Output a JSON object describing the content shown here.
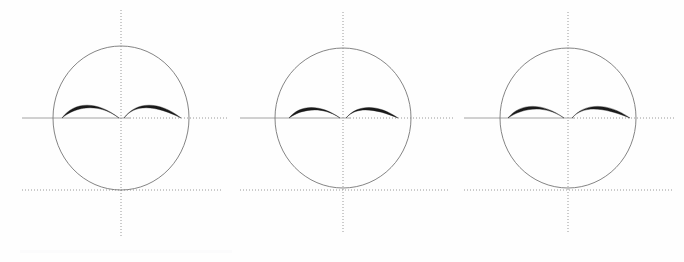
{
  "canvas": {
    "width": 684,
    "height": 262,
    "background_color": "#fefefe",
    "title": "Three circle-and-axis constructions with paired crescent arcs"
  },
  "style_tokens": {
    "circle_stroke_color": "#767676",
    "circle_stroke_width": 0.9,
    "axis_solid_color": "#9a9a9a",
    "axis_dotted_color": "#8f8f8f",
    "axis_stroke_width": 0.9,
    "axis_dash_pattern": "1 2",
    "crescent_fill_color": "#1a1a1a",
    "smudge_color": "#fbfbfc"
  },
  "figures": [
    {
      "id": "figure-1",
      "label": "figure-1",
      "panel_left": 0,
      "panel_width": 232,
      "circle": {
        "cx": 121,
        "cy": 118,
        "rx": 68,
        "ry": 72
      },
      "vertical_axis": {
        "x": 121,
        "y1": 10,
        "y2": 236,
        "style": "dotted"
      },
      "horizontal_center_axis": {
        "y": 118,
        "x1": 22,
        "x2": 228,
        "style": "solid-with-dotted-tail",
        "solid_to": 130
      },
      "horizontal_tangent_axis": {
        "y": 190,
        "x1": 22,
        "x2": 222,
        "style": "dotted"
      },
      "left_crescent": {
        "x_start": 62,
        "x_end": 119,
        "peak_offset_y": -11,
        "thick_end": "left",
        "max_thickness": 3.0
      },
      "right_crescent": {
        "x_start": 124,
        "x_end": 181,
        "peak_offset_y": -11,
        "thick_end": "right",
        "max_thickness": 3.0
      }
    },
    {
      "id": "figure-2",
      "label": "figure-2",
      "panel_left": 232,
      "panel_width": 226,
      "circle": {
        "cx": 111,
        "cy": 118,
        "rx": 68,
        "ry": 70
      },
      "vertical_axis": {
        "x": 111,
        "y1": 12,
        "y2": 232,
        "style": "dotted"
      },
      "horizontal_center_axis": {
        "y": 118,
        "x1": 8,
        "x2": 222,
        "style": "solid-with-dotted-tail",
        "solid_to": 118
      },
      "horizontal_tangent_axis": {
        "y": 190,
        "x1": 8,
        "x2": 218,
        "style": "dotted"
      },
      "left_crescent": {
        "x_start": 57,
        "x_end": 108,
        "peak_offset_y": -9,
        "thick_end": "left",
        "max_thickness": 2.8
      },
      "right_crescent": {
        "x_start": 114,
        "x_end": 166,
        "peak_offset_y": -9,
        "thick_end": "right",
        "max_thickness": 2.8
      }
    },
    {
      "id": "figure-3",
      "label": "figure-3",
      "panel_left": 458,
      "panel_width": 226,
      "circle": {
        "cx": 110,
        "cy": 118,
        "rx": 68,
        "ry": 70
      },
      "vertical_axis": {
        "x": 110,
        "y1": 12,
        "y2": 232,
        "style": "dotted"
      },
      "horizontal_center_axis": {
        "y": 118,
        "x1": 6,
        "x2": 218,
        "style": "solid-with-dotted-tail",
        "solid_to": 116
      },
      "horizontal_tangent_axis": {
        "y": 190,
        "x1": 6,
        "x2": 214,
        "style": "dotted"
      },
      "left_crescent": {
        "x_start": 50,
        "x_end": 106,
        "peak_offset_y": -10,
        "thick_end": "left",
        "max_thickness": 3.2
      },
      "right_crescent": {
        "x_start": 114,
        "x_end": 172,
        "peak_offset_y": -10,
        "thick_end": "right",
        "max_thickness": 3.2
      }
    }
  ],
  "artifacts": {
    "bottom_smudge": {
      "x": 20,
      "y": 250,
      "width": 212,
      "height": 3
    }
  }
}
